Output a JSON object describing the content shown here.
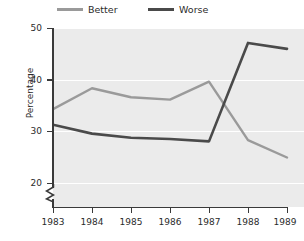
{
  "chart_data": {
    "type": "line",
    "title": "",
    "xlabel": "",
    "ylabel": "Percentage",
    "categories": [
      "1983",
      "1984",
      "1985",
      "1986",
      "1987",
      "1988",
      "1989"
    ],
    "x": [
      1983,
      1984,
      1985,
      1986,
      1987,
      1988,
      1989
    ],
    "ylim": [
      20,
      50
    ],
    "yticks": [
      20,
      30,
      40,
      50
    ],
    "ytick_labels": [
      "20",
      "30",
      "40",
      "50"
    ],
    "grid": true,
    "y_axis_break": true,
    "legend_position": "top",
    "series": [
      {
        "name": "Better",
        "color": "#9a9a9a",
        "values": [
          36.4,
          39.9,
          38.4,
          38.0,
          41.0,
          31.2,
          28.3
        ]
      },
      {
        "name": "Worse",
        "color": "#4a4a4a",
        "values": [
          33.8,
          32.3,
          31.6,
          31.4,
          31.0,
          47.5,
          46.5
        ]
      }
    ]
  },
  "legend": {
    "items": [
      {
        "label": "Better",
        "color": "#9a9a9a"
      },
      {
        "label": "Worse",
        "color": "#4a4a4a"
      }
    ]
  },
  "axes": {
    "y_title": "Percentage",
    "y_tick_labels": [
      "50",
      "40",
      "30",
      "20"
    ],
    "x_tick_labels": [
      "1983",
      "1984",
      "1985",
      "1986",
      "1987",
      "1988",
      "1989"
    ]
  },
  "colors": {
    "panel_background": "#ebebeb",
    "gridline": "#ffffff",
    "axis": "#3a3a3a",
    "text": "#2b2b2b",
    "better_line": "#9a9a9a",
    "worse_line": "#4a4a4a"
  }
}
